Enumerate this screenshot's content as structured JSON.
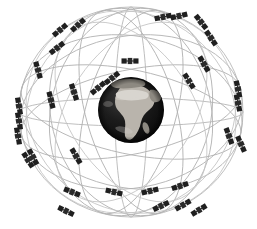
{
  "figure": {
    "width": 257,
    "height": 229,
    "background_color": "#ffffff"
  },
  "earth": {
    "label": "Earth",
    "center_x": 131,
    "center_y": 110,
    "radius": 33,
    "base_color": "#131313",
    "land_color": "#b9b4ac",
    "ocean_color": "#0d0d0d",
    "visible_continent": "Africa"
  },
  "orbits": {
    "label": "Orbital planes",
    "stroke_color": "#b2b2b2",
    "stroke_width": 0.85,
    "count": 12,
    "shell_center_x": 131,
    "shell_center_y": 112,
    "shell_radius_x": 118,
    "shell_radius_y": 110,
    "planes": [
      {
        "name": "plane-outer-meridian",
        "rx": 118,
        "ry": 110,
        "rotation": 0,
        "squash": 1.0
      },
      {
        "name": "plane-outer-equator",
        "rx": 118,
        "ry": 110,
        "rotation": 90,
        "squash": 1.0
      },
      {
        "name": "plane-inclined-a",
        "rx": 118,
        "ry": 110,
        "rotation": 18,
        "squash": 0.4
      },
      {
        "name": "plane-inclined-b",
        "rx": 118,
        "ry": 110,
        "rotation": 52,
        "squash": 0.4
      },
      {
        "name": "plane-inclined-c",
        "rx": 118,
        "ry": 110,
        "rotation": 128,
        "squash": 0.4
      },
      {
        "name": "plane-inclined-d",
        "rx": 118,
        "ry": 110,
        "rotation": 162,
        "squash": 0.4
      },
      {
        "name": "plane-inclined-e",
        "rx": 118,
        "ry": 110,
        "rotation": 35,
        "squash": 0.72
      },
      {
        "name": "plane-inclined-f",
        "rx": 118,
        "ry": 110,
        "rotation": 145,
        "squash": 0.72
      },
      {
        "name": "plane-inclined-g",
        "rx": 118,
        "ry": 110,
        "rotation": 70,
        "squash": 0.55
      },
      {
        "name": "plane-inclined-h",
        "rx": 118,
        "ry": 110,
        "rotation": 110,
        "squash": 0.55
      },
      {
        "name": "plane-equatorial-band-upper",
        "rx": 118,
        "ry": 110,
        "rotation": 90,
        "squash": 0.3
      },
      {
        "name": "plane-equatorial-band-lower",
        "rx": 118,
        "ry": 110,
        "rotation": 90,
        "squash": 0.14
      }
    ]
  },
  "satellites": {
    "label": "Satellites",
    "count": 33,
    "body_color": "#2a2a2a",
    "panel_color": "#1f1f1f",
    "items": [
      {
        "id": "sat-01",
        "x": 60,
        "y": 30,
        "angle": -40,
        "scale": 1.0
      },
      {
        "id": "sat-02",
        "x": 78,
        "y": 25,
        "angle": -42,
        "scale": 1.0
      },
      {
        "id": "sat-03",
        "x": 57,
        "y": 48,
        "angle": -38,
        "scale": 1.0
      },
      {
        "id": "sat-04",
        "x": 130,
        "y": 61,
        "angle": 0,
        "scale": 1.0
      },
      {
        "id": "sat-05",
        "x": 163,
        "y": 17,
        "angle": -12,
        "scale": 1.0
      },
      {
        "id": "sat-06",
        "x": 179,
        "y": 16,
        "angle": -14,
        "scale": 1.0
      },
      {
        "id": "sat-07",
        "x": 201,
        "y": 22,
        "angle": 52,
        "scale": 1.0
      },
      {
        "id": "sat-08",
        "x": 211,
        "y": 38,
        "angle": 56,
        "scale": 1.0
      },
      {
        "id": "sat-09",
        "x": 112,
        "y": 78,
        "angle": -38,
        "scale": 1.0
      },
      {
        "id": "sat-10",
        "x": 98,
        "y": 88,
        "angle": -40,
        "scale": 1.0
      },
      {
        "id": "sat-11",
        "x": 74,
        "y": 92,
        "angle": 72,
        "scale": 1.0
      },
      {
        "id": "sat-12",
        "x": 51,
        "y": 100,
        "angle": 76,
        "scale": 1.0
      },
      {
        "id": "sat-13",
        "x": 19,
        "y": 106,
        "angle": 80,
        "scale": 1.0
      },
      {
        "id": "sat-14",
        "x": 19,
        "y": 121,
        "angle": 80,
        "scale": 1.0
      },
      {
        "id": "sat-15",
        "x": 18,
        "y": 136,
        "angle": 80,
        "scale": 1.0
      },
      {
        "id": "sat-16",
        "x": 33,
        "y": 157,
        "angle": 62,
        "scale": 1.0
      },
      {
        "id": "sat-17",
        "x": 76,
        "y": 156,
        "angle": 60,
        "scale": 1.0
      },
      {
        "id": "sat-18",
        "x": 189,
        "y": 81,
        "angle": 58,
        "scale": 1.0
      },
      {
        "id": "sat-19",
        "x": 238,
        "y": 89,
        "angle": 78,
        "scale": 1.0
      },
      {
        "id": "sat-20",
        "x": 238,
        "y": 103,
        "angle": 78,
        "scale": 1.0
      },
      {
        "id": "sat-21",
        "x": 229,
        "y": 136,
        "angle": 70,
        "scale": 1.0
      },
      {
        "id": "sat-22",
        "x": 241,
        "y": 144,
        "angle": 66,
        "scale": 1.0
      },
      {
        "id": "sat-23",
        "x": 28,
        "y": 160,
        "angle": 58,
        "scale": 1.0
      },
      {
        "id": "sat-24",
        "x": 72,
        "y": 192,
        "angle": 22,
        "scale": 1.0
      },
      {
        "id": "sat-25",
        "x": 114,
        "y": 192,
        "angle": 14,
        "scale": 1.0
      },
      {
        "id": "sat-26",
        "x": 150,
        "y": 191,
        "angle": -14,
        "scale": 1.0
      },
      {
        "id": "sat-27",
        "x": 180,
        "y": 186,
        "angle": -18,
        "scale": 1.0
      },
      {
        "id": "sat-28",
        "x": 66,
        "y": 211,
        "angle": 26,
        "scale": 1.0
      },
      {
        "id": "sat-29",
        "x": 183,
        "y": 205,
        "angle": -30,
        "scale": 1.0
      },
      {
        "id": "sat-30",
        "x": 199,
        "y": 210,
        "angle": -32,
        "scale": 1.0
      },
      {
        "id": "sat-31",
        "x": 161,
        "y": 206,
        "angle": -26,
        "scale": 1.0
      },
      {
        "id": "sat-32",
        "x": 204,
        "y": 64,
        "angle": 60,
        "scale": 1.0
      },
      {
        "id": "sat-33",
        "x": 38,
        "y": 70,
        "angle": 74,
        "scale": 1.0
      }
    ]
  }
}
